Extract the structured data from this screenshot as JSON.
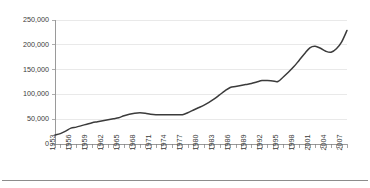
{
  "chart_data": {
    "type": "line",
    "title": "",
    "subtitle": "",
    "xlabel": "",
    "ylabel": "",
    "grid": true,
    "legend": false,
    "legend_position": "none",
    "line_color": "#3b3b3b",
    "grid_color": "#e4e4e4",
    "axis_color": "#9a9a9a",
    "text_color": "#3a3a3a",
    "background_color": "#ffffff",
    "ylim": [
      0,
      250000
    ],
    "xlim": [
      1953,
      2008
    ],
    "y_ticks": [
      0,
      50000,
      100000,
      150000,
      200000,
      250000
    ],
    "y_tick_labels": [
      "0",
      "50,000",
      "100,000",
      "150,000",
      "200,000",
      "250,000"
    ],
    "x_tick_labels": [
      "1953",
      "1956",
      "1959",
      "1962",
      "1965",
      "1968",
      "1971",
      "1974",
      "1977",
      "1980",
      "1983",
      "1986",
      "1989",
      "1992",
      "1995",
      "1998",
      "2001",
      "2004",
      "2007"
    ],
    "x_tick_label_interval": 3,
    "x_minor_tick_interval": 1,
    "x_label_rotation": -90,
    "x": [
      1953,
      1954,
      1955,
      1956,
      1957,
      1958,
      1959,
      1960,
      1961,
      1962,
      1963,
      1964,
      1965,
      1966,
      1967,
      1968,
      1969,
      1970,
      1971,
      1972,
      1973,
      1974,
      1975,
      1976,
      1977,
      1978,
      1979,
      1980,
      1981,
      1982,
      1983,
      1984,
      1985,
      1986,
      1987,
      1988,
      1989,
      1990,
      1991,
      1992,
      1993,
      1994,
      1995,
      1996,
      1997,
      1998,
      1999,
      2000,
      2001,
      2002,
      2003,
      2004,
      2005,
      2006,
      2007,
      2008
    ],
    "values": [
      17000,
      20000,
      25000,
      31000,
      33000,
      36000,
      39000,
      42000,
      44000,
      46000,
      48000,
      50000,
      52000,
      56000,
      59000,
      61000,
      62000,
      61000,
      59000,
      58000,
      58000,
      58000,
      58000,
      58000,
      58000,
      62000,
      67000,
      72000,
      77000,
      83000,
      90000,
      98000,
      106000,
      113000,
      115000,
      117000,
      119000,
      121000,
      124000,
      127000,
      127000,
      126000,
      125000,
      134000,
      144000,
      155000,
      168000,
      181000,
      193000,
      196000,
      192000,
      186000,
      184000,
      191000,
      205000,
      228000
    ],
    "series": [
      {
        "name": "series-1",
        "values": [
          17000,
          20000,
          25000,
          31000,
          33000,
          36000,
          39000,
          42000,
          44000,
          46000,
          48000,
          50000,
          52000,
          56000,
          59000,
          61000,
          62000,
          61000,
          59000,
          58000,
          58000,
          58000,
          58000,
          58000,
          58000,
          62000,
          67000,
          72000,
          77000,
          83000,
          90000,
          98000,
          106000,
          113000,
          115000,
          117000,
          119000,
          121000,
          124000,
          127000,
          127000,
          126000,
          125000,
          134000,
          144000,
          155000,
          168000,
          181000,
          193000,
          196000,
          192000,
          186000,
          184000,
          191000,
          205000,
          228000
        ]
      }
    ]
  }
}
